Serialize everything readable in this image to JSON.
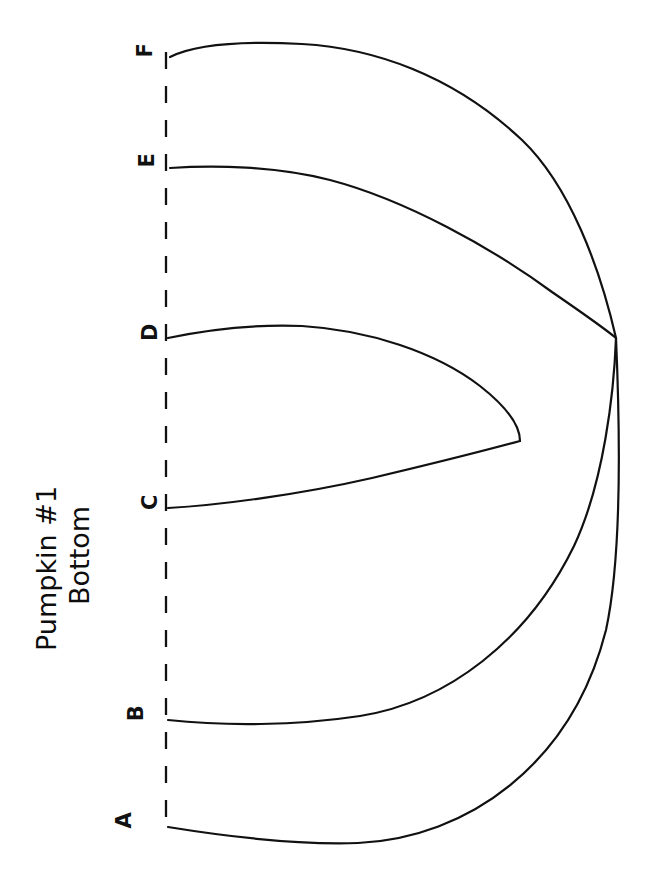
{
  "document": {
    "kind": "hand-drawn-sketch",
    "title_line_1": "Pumpkin #1",
    "title_line_2": "Bottom",
    "ink_color": "#111111",
    "paper_color": "#ffffff",
    "title_rotation_degrees": -90
  },
  "axis": {
    "name": "vertical-dashed-axis",
    "style": "dashed",
    "color": "#111111"
  },
  "points": [
    {
      "id": "F",
      "label": "F"
    },
    {
      "id": "E",
      "label": "E"
    },
    {
      "id": "D",
      "label": "D"
    },
    {
      "id": "C",
      "label": "C"
    },
    {
      "id": "B",
      "label": "B"
    },
    {
      "id": "A",
      "label": "A"
    }
  ],
  "chart_data": {
    "type": "line",
    "title": "Pumpkin #1 Bottom",
    "xlabel": "",
    "ylabel": "",
    "xlim": [
      0,
      651
    ],
    "ylim": [
      877,
      0
    ],
    "grid": false,
    "legend": "none",
    "orientation": "page rotated 90 degrees counter-clockwise",
    "annotations": [
      "Hand-drawn pumpkin bottom profile traces",
      "Six traces labeled A through F leave the dashed axis",
      "Traces C and D close into an inner loop",
      "Traces A, B, E and F converge at a common right-hand point"
    ],
    "axis_line": {
      "label": "dashed-reference-line",
      "x": 166,
      "y_start": 52,
      "y_end": 830,
      "dash_length": 17,
      "gap_length": 17
    },
    "convergence_point": {
      "x": 616,
      "y": 338
    },
    "series": [
      {
        "name": "F",
        "start": {
          "x": 170,
          "y": 56
        },
        "end": {
          "x": 616,
          "y": 338
        },
        "label_position": {
          "x": 146,
          "y": 50
        },
        "path": "M170,57 C196,44 246,41 302,44 C372,48 452,74 522,140 C570,186 600,268 616,338"
      },
      {
        "name": "E",
        "start": {
          "x": 170,
          "y": 168
        },
        "end": {
          "x": 616,
          "y": 338
        },
        "label_position": {
          "x": 148,
          "y": 160
        },
        "path": "M170,168 C214,165 276,166 330,180 C406,200 492,248 552,292 C584,314 604,328 616,338"
      },
      {
        "name": "D",
        "start": {
          "x": 168,
          "y": 338
        },
        "end": {
          "x": 520,
          "y": 441
        },
        "label_position": {
          "x": 149,
          "y": 331
        },
        "path": "M168,338 C206,330 252,324 302,326 C368,330 436,352 480,386 C508,408 520,426 520,441"
      },
      {
        "name": "C",
        "start": {
          "x": 168,
          "y": 508
        },
        "end": {
          "x": 520,
          "y": 441
        },
        "label_position": {
          "x": 150,
          "y": 500
        },
        "path": "M168,508 C222,505 302,494 372,478 C440,462 494,448 520,441"
      },
      {
        "name": "B",
        "start": {
          "x": 168,
          "y": 720
        },
        "end": {
          "x": 616,
          "y": 338
        },
        "label_position": {
          "x": 136,
          "y": 712
        },
        "path": "M168,720 C224,726 294,726 360,716 C448,702 528,640 574,546 C604,482 614,392 616,338"
      },
      {
        "name": "A",
        "start": {
          "x": 168,
          "y": 827
        },
        "end": {
          "x": 616,
          "y": 338
        },
        "label_position": {
          "x": 124,
          "y": 820
        },
        "path": "M168,827 C236,838 300,845 358,843 C468,838 572,764 606,630 C622,556 620,430 616,338"
      }
    ]
  }
}
